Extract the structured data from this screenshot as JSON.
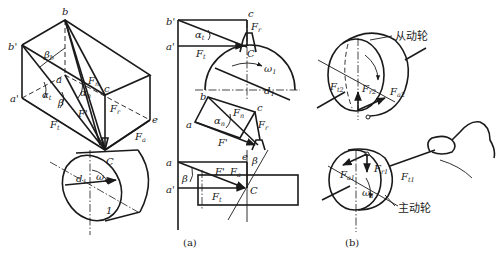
{
  "figure": {
    "captions": {
      "a": "(a)",
      "b": "(b)"
    }
  },
  "panel_a_iso": {
    "points": {
      "b": "b",
      "b_prime": "b'",
      "a": "a",
      "a_prime": "a'",
      "c": "c",
      "e": "e",
      "C": "C",
      "gear_no": "1"
    },
    "angles": {
      "beta_b": "β",
      "beta_b_sub": "b",
      "alpha_t": "α",
      "alpha_t_sub": "t",
      "beta": "β",
      "alpha_n": "α",
      "alpha_n_sub": "n",
      "omega": "ω",
      "omega_sub": "1"
    },
    "forces": {
      "Fn": "F",
      "Fn_sub": "n",
      "Fr": "F",
      "Fr_sub": "r",
      "Ft": "F",
      "Ft_sub": "t",
      "Fa": "F",
      "Fa_sub": "a",
      "Fprime": "F'"
    },
    "diameter": {
      "d": "d",
      "d_sub": "1"
    }
  },
  "panel_a_views": {
    "top": {
      "b_prime": "b'",
      "c": "c",
      "a_prime": "a'",
      "alpha_t": "α",
      "alpha_t_sub": "t",
      "Fr": "F",
      "Fr_sub": "r",
      "Ft": "F",
      "Ft_sub": "t",
      "C": "C",
      "omega": "ω",
      "omega_sub": "1",
      "d": "d",
      "d_sub": "1"
    },
    "middle": {
      "b": "b",
      "a": "a",
      "c": "c",
      "e": "e",
      "alpha_n": "α",
      "alpha_n_sub": "n",
      "Fn": "F",
      "Fn_sub": "n",
      "Fprime": "F'",
      "Fr": "F",
      "Fr_sub": "r",
      "beta": "β"
    },
    "bottom": {
      "a": "a",
      "a_prime": "a'",
      "beta": "β",
      "Fprime": "F'",
      "Fa": "F",
      "Fa_sub": "a",
      "Ft": "F",
      "Ft_sub": "t",
      "C": "C"
    }
  },
  "panel_b": {
    "driven_label": "从动轮",
    "driver_label": "主动轮",
    "driven_forces": {
      "Ft2": "F",
      "Ft2_sub": "t2",
      "Fr2": "F",
      "Fr2_sub": "r2",
      "Fa2": "F",
      "Fa2_sub": "a2"
    },
    "driver_forces": {
      "Fa1": "F",
      "Fa1_sub": "a1",
      "Fr1": "F",
      "Fr1_sub": "r1",
      "Ft1": "F",
      "Ft1_sub": "t1",
      "omega": "ω",
      "omega_sub": "1"
    }
  }
}
